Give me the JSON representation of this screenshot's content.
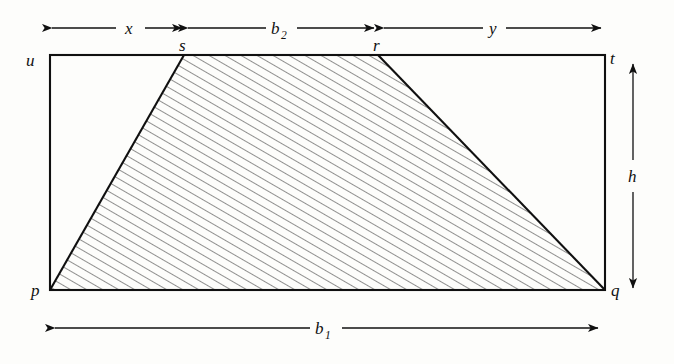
{
  "figure": {
    "type": "geometry-diagram",
    "background_color": "#fdfdfb",
    "line_color": "#101010",
    "hatch_color": "#2b2b2b",
    "canvas": {
      "width": 674,
      "height": 364
    }
  },
  "vertex_labels": {
    "u": "u",
    "t": "t",
    "p": "p",
    "q": "q",
    "s": "s",
    "r": "r"
  },
  "dimension_labels": {
    "x": "x",
    "b2_base": "b",
    "b2_sub": "2",
    "y": "y",
    "h": "h",
    "b1_base": "b",
    "b1_sub": "1"
  },
  "geometry": {
    "rectangle": {
      "left": 50,
      "top": 55,
      "right": 605,
      "bottom": 290,
      "width": 555,
      "height": 235
    },
    "trapezoid_vertices": {
      "p": [
        50,
        290
      ],
      "s": [
        184,
        55
      ],
      "r": [
        378,
        55
      ],
      "q": [
        605,
        290
      ]
    },
    "hatching": {
      "angle_deg": 60,
      "spacing_px": 8,
      "direction": "bottom-left to top-right"
    }
  },
  "dimensions": [
    {
      "name": "x",
      "orientation": "horizontal",
      "from": 50,
      "to": 184,
      "axis_pos": 28,
      "label_x": 130,
      "label_y": 33
    },
    {
      "name": "b2",
      "orientation": "horizontal",
      "from": 184,
      "to": 378,
      "axis_pos": 28,
      "label_x": 281,
      "label_y": 33
    },
    {
      "name": "y",
      "orientation": "horizontal",
      "from": 378,
      "to": 605,
      "axis_pos": 28,
      "label_x": 493,
      "label_y": 33
    },
    {
      "name": "h",
      "orientation": "vertical",
      "from": 62,
      "to": 292,
      "axis_pos": 633,
      "label_x": 637,
      "label_y": 181
    },
    {
      "name": "b1",
      "orientation": "horizontal",
      "from": 50,
      "to": 600,
      "axis_pos": 328,
      "label_x": 325,
      "label_y": 333
    }
  ]
}
